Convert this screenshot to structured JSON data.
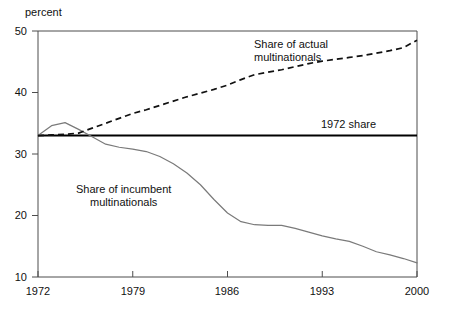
{
  "chart_data": {
    "type": "line",
    "title": "",
    "xlabel": "",
    "ylabel": "percent",
    "ylim": [
      10,
      50
    ],
    "xlim": [
      1972,
      2000
    ],
    "yticks": [
      50,
      40,
      30,
      20,
      10
    ],
    "xticks": [
      1972,
      1979,
      1986,
      1993,
      2000
    ],
    "grid": false,
    "legend_position": "inline-annotations",
    "annotations": [
      {
        "id": "actual",
        "text_line1": "Share of actual",
        "text_line2": "multinationals"
      },
      {
        "id": "reference",
        "text": "1972 share"
      },
      {
        "id": "incumbent",
        "text_line1": "Share of incumbent",
        "text_line2": "multinationals"
      }
    ],
    "reference_line": {
      "label": "1972 share",
      "value": 33.0,
      "style": "solid",
      "color": "#000000"
    },
    "x": [
      1972,
      1973,
      1974,
      1975,
      1976,
      1977,
      1978,
      1979,
      1980,
      1981,
      1982,
      1983,
      1984,
      1985,
      1986,
      1987,
      1988,
      1989,
      1990,
      1991,
      1992,
      1993,
      1994,
      1995,
      1996,
      1997,
      1998,
      1999,
      2000
    ],
    "series": [
      {
        "name": "Share of actual multinationals",
        "style": "dashed",
        "color": "#111111",
        "values": [
          33.0,
          33.1,
          33.2,
          33.4,
          34.2,
          35.0,
          35.8,
          36.6,
          37.2,
          37.9,
          38.6,
          39.3,
          39.9,
          40.5,
          41.2,
          42.1,
          42.9,
          43.3,
          43.7,
          44.2,
          44.7,
          45.1,
          45.4,
          45.7,
          46.0,
          46.4,
          46.8,
          47.3,
          48.5
        ]
      },
      {
        "name": "Share of incumbent multinationals",
        "style": "solid",
        "color": "#7a7a7a",
        "values": [
          33.0,
          34.6,
          35.1,
          34.0,
          32.8,
          31.6,
          31.1,
          30.8,
          30.4,
          29.6,
          28.4,
          26.9,
          25.0,
          22.6,
          20.4,
          19.0,
          18.5,
          18.4,
          18.4,
          17.9,
          17.3,
          16.7,
          16.2,
          15.8,
          15.0,
          14.1,
          13.6,
          13.0,
          12.3
        ]
      }
    ]
  },
  "labels": {
    "y_axis_caption": "percent",
    "ytick_50": "50",
    "ytick_40": "40",
    "ytick_30": "30",
    "ytick_20": "20",
    "ytick_10": "10",
    "xtick_1972": "1972",
    "xtick_1979": "1979",
    "xtick_1986": "1986",
    "xtick_1993": "1993",
    "xtick_2000": "2000",
    "annot_actual_l1": "Share of actual",
    "annot_actual_l2": "multinationals",
    "annot_reference": "1972 share",
    "annot_incumbent_l1": "Share of incumbent",
    "annot_incumbent_l2": "multinationals"
  },
  "colors": {
    "axis": "#4d4d4d",
    "incumbent": "#7a7a7a",
    "actual": "#111111",
    "reference": "#000000",
    "background": "#ffffff"
  }
}
